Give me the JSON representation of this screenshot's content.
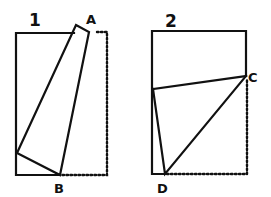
{
  "figures": [
    {
      "number": "1",
      "points": {
        "A": "A",
        "B": "B"
      }
    },
    {
      "number": "2",
      "points": {
        "C": "C",
        "D": "D"
      }
    }
  ],
  "colors": {
    "ink": "#111111",
    "paper": "#ffffff"
  }
}
